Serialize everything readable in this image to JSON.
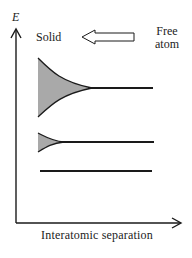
{
  "figure": {
    "y_axis_label": "E",
    "x_axis_label": "Interatomic separation",
    "left_label": "Solid",
    "right_label_line1": "Free",
    "right_label_line2": "atom",
    "arrow_direction": "left",
    "colors": {
      "line": "#1a1a1a",
      "band_fill": "#a9a9a9",
      "background": "#ffffff"
    }
  },
  "energy_levels": [
    {
      "name": "upper-level",
      "y": 88,
      "band_top": 58,
      "band_bottom": 117,
      "band_converges_at_x": 92,
      "x_start": 38,
      "x_end": 153
    },
    {
      "name": "middle-level",
      "y": 142,
      "band_top": 133,
      "band_bottom": 152,
      "band_converges_at_x": 62,
      "x_start": 38,
      "x_end": 154
    },
    {
      "name": "lower-level",
      "y": 171,
      "band_top": null,
      "band_bottom": null,
      "x_start": 40,
      "x_end": 152
    }
  ]
}
